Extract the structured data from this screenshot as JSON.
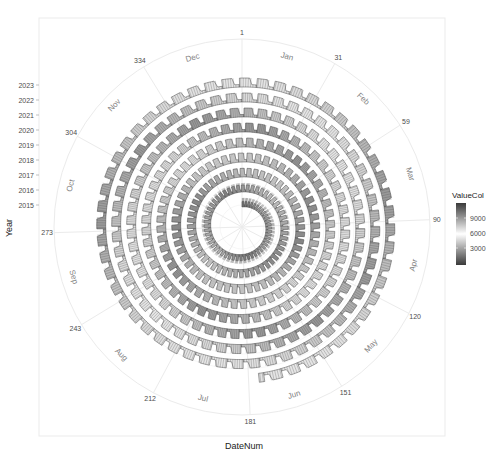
{
  "chart_data": {
    "type": "area",
    "coord": "polar-spiral",
    "title": "",
    "xlabel": "DateNum",
    "ylabel": "Year",
    "x_ticks": [
      1,
      31,
      59,
      90,
      120,
      151,
      181,
      212,
      243,
      273,
      304,
      334
    ],
    "x_tick_labels": [
      "1",
      "31",
      "59",
      "90",
      "120",
      "151",
      "181",
      "212",
      "243",
      "273",
      "304",
      "334"
    ],
    "month_labels": [
      "Jan",
      "Feb",
      "Mar",
      "Apr",
      "May",
      "Jun",
      "Jul",
      "Aug",
      "Sep",
      "Oct",
      "Nov",
      "Dec"
    ],
    "x_range": [
      1,
      366
    ],
    "y_ticks": [
      2015,
      2016,
      2017,
      2018,
      2019,
      2020,
      2021,
      2022,
      2023
    ],
    "y_tick_labels": [
      "2015",
      "2016",
      "2017",
      "2018",
      "2019",
      "2020",
      "2021",
      "2022",
      "2023"
    ],
    "spiral_start": {
      "year": 2015,
      "day": 1
    },
    "spiral_end": {
      "year": 2023,
      "day": 176
    },
    "pattern": "weekly sawtooth: 5 high weekdays, 2 low weekend days",
    "legend": {
      "title": "ValueCol",
      "ticks": [
        3000,
        6000,
        9000
      ],
      "tick_labels": [
        "3000",
        "6000",
        "9000"
      ],
      "colors": [
        "#404040",
        "#ffffff",
        "#404040"
      ],
      "position": "right"
    },
    "grid": true
  },
  "legend_title": "ValueCol"
}
